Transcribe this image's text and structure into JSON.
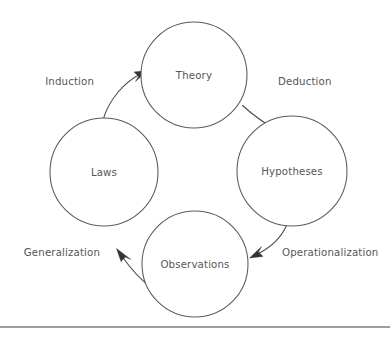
{
  "diagram": {
    "type": "cycle-diagram",
    "background_color": "#ffffff",
    "stroke_color": "#5a5a5a",
    "text_color": "#565656",
    "arrow_color": "#333333",
    "nodes": [
      {
        "id": "theory",
        "label": "Theory",
        "cx": 194,
        "cy": 75,
        "r": 53
      },
      {
        "id": "hypotheses",
        "label": "Hypotheses",
        "cx": 292,
        "cy": 171,
        "r": 55
      },
      {
        "id": "observations",
        "label": "Observations",
        "cx": 195,
        "cy": 264,
        "r": 53
      },
      {
        "id": "laws",
        "label": "Laws",
        "cx": 104,
        "cy": 172,
        "r": 54
      }
    ],
    "edges": [
      {
        "id": "deduction",
        "label": "Deduction",
        "from": "theory",
        "to": "hypotheses",
        "label_x": 278,
        "label_y": 85,
        "label_anchor": "start"
      },
      {
        "id": "operationalization",
        "label": "Operationalization",
        "from": "hypotheses",
        "to": "observations",
        "label_x": 282,
        "label_y": 256,
        "label_anchor": "start"
      },
      {
        "id": "generalization",
        "label": "Generalization",
        "from": "observations",
        "to": "laws",
        "label_x": 100,
        "label_y": 256,
        "label_anchor": "end"
      },
      {
        "id": "induction",
        "label": "Induction",
        "from": "laws",
        "to": "theory",
        "label_x": 94,
        "label_y": 85,
        "label_anchor": "end"
      }
    ],
    "footer_rule": {
      "y": 327,
      "x1": 0,
      "x2": 390,
      "color": "#3b3b3b"
    }
  }
}
